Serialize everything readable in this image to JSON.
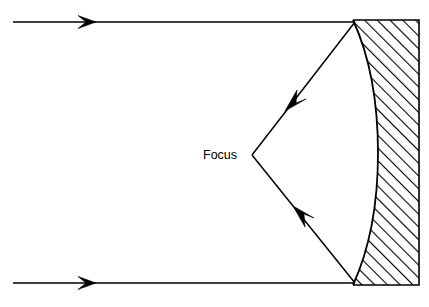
{
  "diagram": {
    "type": "optics-ray-diagram",
    "labels": {
      "focus": "Focus"
    },
    "colors": {
      "stroke": "#000000",
      "background": "#ffffff",
      "hatch": "#000000"
    },
    "geometry": {
      "canvas": {
        "width": 429,
        "height": 307
      },
      "focus_point": {
        "x": 252,
        "y": 155
      },
      "incoming_rays": [
        {
          "name": "top-incoming-ray",
          "x1": 13,
          "y1": 22,
          "x2": 355,
          "y2": 22,
          "arrow_at_x": 92
        },
        {
          "name": "bottom-incoming-ray",
          "x1": 13,
          "y1": 283,
          "x2": 355,
          "y2": 283,
          "arrow_at_x": 92
        }
      ],
      "reflected_rays": [
        {
          "name": "top-reflected-ray",
          "x1": 355,
          "y1": 22,
          "x2": 252,
          "y2": 155,
          "arrow_at": {
            "x": 296,
            "y": 98
          }
        },
        {
          "name": "bottom-reflected-ray",
          "x1": 355,
          "y1": 283,
          "x2": 252,
          "y2": 155,
          "arrow_at": {
            "x": 304,
            "y": 219
          }
        }
      ],
      "mirror": {
        "top_left": {
          "x": 353,
          "y": 20
        },
        "bottom_left": {
          "x": 353,
          "y": 285
        },
        "right_edge_x": 419,
        "curve_apex": {
          "x": 378,
          "y": 153
        },
        "hatch_angle_deg": -45
      }
    }
  }
}
